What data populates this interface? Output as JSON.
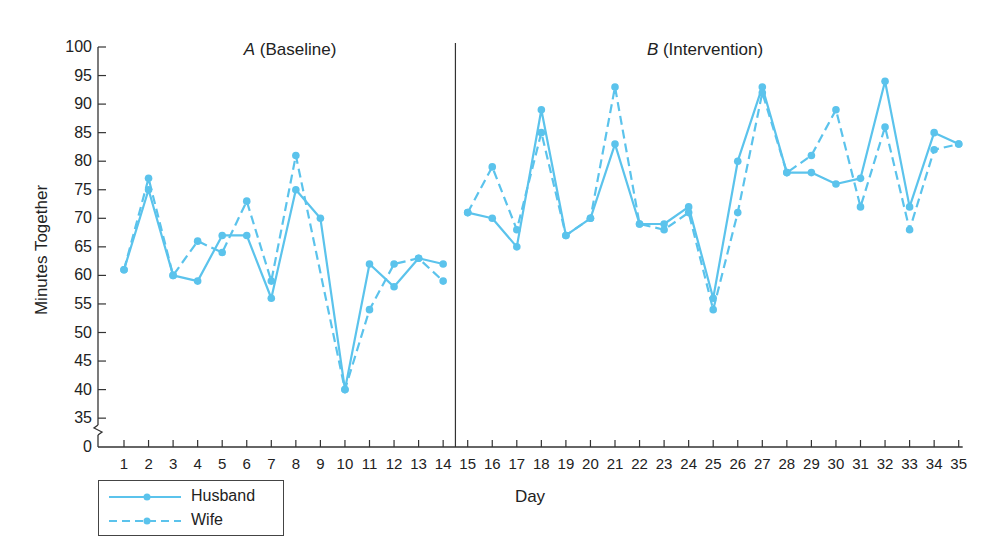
{
  "chart_data": {
    "type": "line",
    "title": "",
    "xlabel": "Day",
    "ylabel": "Minutes Together",
    "ylim": [
      35,
      100
    ],
    "y_axis_break": true,
    "y_ticks": [
      0,
      35,
      40,
      45,
      50,
      55,
      60,
      65,
      70,
      75,
      80,
      85,
      90,
      95,
      100
    ],
    "x": [
      1,
      2,
      3,
      4,
      5,
      6,
      7,
      8,
      9,
      10,
      11,
      12,
      13,
      14,
      15,
      16,
      17,
      18,
      19,
      20,
      21,
      22,
      23,
      24,
      25,
      26,
      27,
      28,
      29,
      30,
      31,
      32,
      33,
      34,
      35
    ],
    "phases": [
      {
        "label_letter": "A",
        "label_text": "(Baseline)",
        "days": [
          1,
          14
        ]
      },
      {
        "label_letter": "B",
        "label_text": "(Intervention)",
        "days": [
          15,
          35
        ]
      }
    ],
    "phase_change_after_day": 14,
    "series": [
      {
        "name": "Husband",
        "style": "solid",
        "color": "#5bc3ec",
        "values": [
          61,
          75,
          60,
          59,
          67,
          67,
          56,
          75,
          70,
          40,
          62,
          58,
          63,
          62,
          71,
          70,
          65,
          89,
          67,
          70,
          83,
          69,
          69,
          72,
          56,
          80,
          93,
          78,
          78,
          76,
          77,
          94,
          72,
          85,
          83
        ]
      },
      {
        "name": "Wife",
        "style": "dashed",
        "color": "#5bc3ec",
        "values": [
          61,
          77,
          60,
          66,
          64,
          73,
          59,
          81,
          null,
          40,
          54,
          62,
          63,
          59,
          71,
          79,
          68,
          85,
          67,
          70,
          93,
          69,
          68,
          71,
          54,
          71,
          92,
          78,
          81,
          89,
          72,
          86,
          68,
          82,
          83
        ]
      }
    ],
    "legend": {
      "position": "bottom-left",
      "entries": [
        "Husband",
        "Wife"
      ]
    },
    "grid": false
  },
  "labels": {
    "phase_a_letter": "A",
    "phase_a_text": " (Baseline)",
    "phase_b_letter": "B",
    "phase_b_text": " (Intervention)",
    "xlabel": "Day",
    "ylabel": "Minutes Together",
    "legend_husband": "Husband",
    "legend_wife": "Wife"
  }
}
